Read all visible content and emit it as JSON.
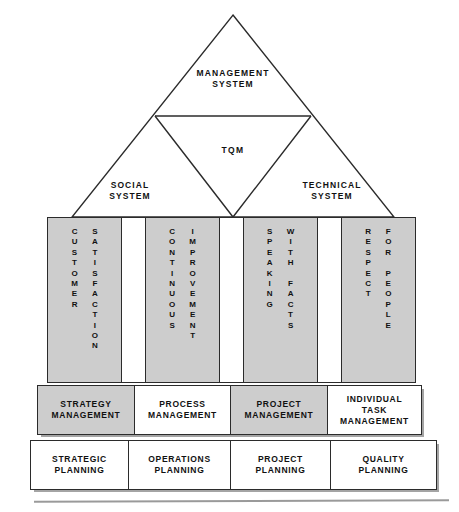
{
  "diagram": {
    "colors": {
      "shaded_fill": "#cdcdcd",
      "plain_fill": "#ffffff",
      "line": "#2b2b2b",
      "text": "#111111",
      "shadow": "#5a5a5a"
    },
    "pyramid": {
      "apex_block_label": "MANAGEMENT\nSYSTEM",
      "core_label": "TQM",
      "left_wing_label": "SOCIAL\nSYSTEM",
      "right_wing_label": "TECHNICAL\nSYSTEM"
    },
    "pillars": [
      {
        "name": "customer-satisfaction",
        "shaded": true,
        "word_left": "CUSTOMER",
        "word_right": "SATISFACTION"
      },
      {
        "name": "pillar-gap-1",
        "shaded": false,
        "word_left": "",
        "word_right": ""
      },
      {
        "name": "continuous-improvement",
        "shaded": true,
        "word_left": "CONTINUOUS",
        "word_right": "IMPROVEMENT"
      },
      {
        "name": "pillar-gap-2",
        "shaded": false,
        "word_left": "",
        "word_right": ""
      },
      {
        "name": "speaking-with-facts",
        "shaded": true,
        "word_left": "SPEAKING",
        "word_right": "WITH FACTS"
      },
      {
        "name": "pillar-gap-3",
        "shaded": false,
        "word_left": "",
        "word_right": ""
      },
      {
        "name": "respect-for-people",
        "shaded": true,
        "word_left": "RESPECT",
        "word_right": "FOR PEOPLE"
      }
    ],
    "management_row": [
      {
        "name": "strategy-management",
        "label": "STRATEGY\nMANAGEMENT",
        "shaded": true
      },
      {
        "name": "process-management",
        "label": "PROCESS\nMANAGEMENT",
        "shaded": false
      },
      {
        "name": "project-management",
        "label": "PROJECT\nMANAGEMENT",
        "shaded": true
      },
      {
        "name": "individual-task-management",
        "label": "INDIVIDUAL\nTASK\nMANAGEMENT",
        "shaded": false
      }
    ],
    "planning_row": [
      {
        "name": "strategic-planning",
        "label": "STRATEGIC\nPLANNING",
        "shaded": false
      },
      {
        "name": "operations-planning",
        "label": "OPERATIONS\nPLANNING",
        "shaded": false
      },
      {
        "name": "project-planning",
        "label": "PROJECT\nPLANNING",
        "shaded": false
      },
      {
        "name": "quality-planning",
        "label": "QUALITY\nPLANNING",
        "shaded": false
      }
    ]
  }
}
